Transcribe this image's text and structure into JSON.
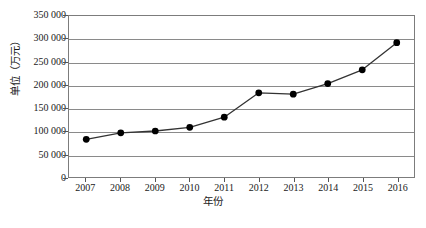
{
  "chart_data": {
    "type": "line",
    "title": "",
    "subtitle": "",
    "categories": [
      "2007",
      "2008",
      "2009",
      "2010",
      "2011",
      "2012",
      "2013",
      "2014",
      "2015",
      "2016"
    ],
    "values": [
      82000,
      96000,
      100000,
      108000,
      130000,
      183000,
      180000,
      203000,
      233000,
      292000
    ],
    "series": [
      {
        "name": "",
        "values": [
          82000,
          96000,
          100000,
          108000,
          130000,
          183000,
          180000,
          203000,
          233000,
          292000
        ]
      }
    ],
    "xlabel": "年份",
    "ylabel": "单位（万元）",
    "ylim": [
      0,
      350000
    ],
    "ytick_labels": [
      "350 000",
      "300 000",
      "250 000",
      "200 000",
      "150 000",
      "100 000",
      "50 000",
      "0"
    ],
    "ytick_values": [
      350000,
      300000,
      250000,
      200000,
      150000,
      100000,
      50000,
      0
    ],
    "grid": true,
    "legend": "none",
    "marker": "filled-circle",
    "line_color": "#333333",
    "marker_color": "#000000",
    "grid_color": "#8a8a8a",
    "frame_color": "#7c7c7c"
  },
  "figure": {
    "caption": ""
  }
}
